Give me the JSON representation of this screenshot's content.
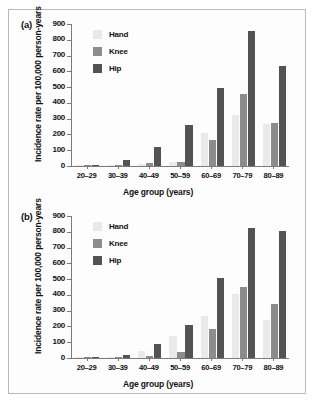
{
  "figure": {
    "panel_a_label": "(a)",
    "panel_b_label": "(b)",
    "caption": ""
  },
  "colors": {
    "hand": "#e9e9e9",
    "knee": "#8c8c8c",
    "hip": "#535353",
    "axis": "#7a7a7a",
    "text": "#111111",
    "frame": "#b9b9b9"
  },
  "chart_data": [
    {
      "type": "bar",
      "panel": "(a)",
      "title": "",
      "xlabel": "Age group (years)",
      "ylabel": "Incidence rate per 100,000 person-years",
      "categories": [
        "20–29",
        "30–39",
        "40–49",
        "50–59",
        "60–69",
        "70–79",
        "80–89"
      ],
      "series": [
        {
          "name": "Hand",
          "values": [
            1,
            3,
            12,
            25,
            210,
            325,
            268
          ]
        },
        {
          "name": "Knee",
          "values": [
            2,
            6,
            20,
            26,
            165,
            455,
            273
          ]
        },
        {
          "name": "Hip",
          "values": [
            5,
            40,
            120,
            258,
            493,
            855,
            633
          ]
        }
      ],
      "ylim": [
        0,
        900
      ],
      "yticks": [
        0,
        100,
        200,
        300,
        400,
        500,
        600,
        700,
        800,
        900
      ],
      "grid": false,
      "legend_position": "top-left"
    },
    {
      "type": "bar",
      "panel": "(b)",
      "title": "",
      "xlabel": "Age group (years)",
      "ylabel": "Incidence rate per 100,000 person-years",
      "categories": [
        "20–29",
        "30–39",
        "40–49",
        "50–59",
        "60–69",
        "70–79",
        "80–89"
      ],
      "series": [
        {
          "name": "Hand",
          "values": [
            1,
            2,
            42,
            140,
            268,
            403,
            240
          ]
        },
        {
          "name": "Knee",
          "values": [
            1,
            4,
            12,
            36,
            182,
            448,
            342
          ]
        },
        {
          "name": "Hip",
          "values": [
            2,
            16,
            86,
            211,
            508,
            825,
            808
          ]
        }
      ],
      "ylim": [
        0,
        900
      ],
      "yticks": [
        0,
        100,
        200,
        300,
        400,
        500,
        600,
        700,
        800,
        900
      ],
      "grid": false,
      "legend_position": "top-left"
    }
  ]
}
